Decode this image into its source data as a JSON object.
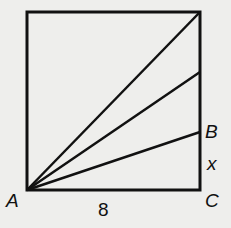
{
  "diagram": {
    "type": "geometry",
    "shape": "square",
    "points": {
      "A": {
        "label": "A",
        "x": 27,
        "y": 190
      },
      "B": {
        "label": "B",
        "x": 200,
        "y": 132
      },
      "C": {
        "label": "C",
        "x": 200,
        "y": 190
      }
    },
    "side_label": "8",
    "segment_label": "x",
    "rays_from_A": [
      {
        "to": [
          200,
          12
        ]
      },
      {
        "to": [
          200,
          72
        ]
      },
      {
        "to": [
          200,
          132
        ]
      }
    ],
    "colors": {
      "stroke": "#111111",
      "background": "#eeeeec"
    }
  }
}
